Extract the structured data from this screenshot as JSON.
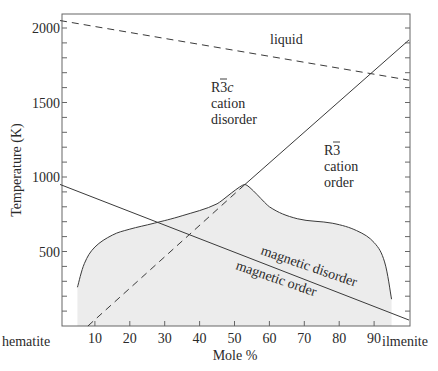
{
  "chart_data": {
    "type": "line",
    "title": "",
    "xlabel": "Mole %",
    "ylabel": "Temperature (K)",
    "xlim": [
      0,
      100
    ],
    "ylim": [
      0,
      2100
    ],
    "grid": false,
    "x_ticks": [
      10,
      20,
      30,
      40,
      50,
      60,
      70,
      80,
      90
    ],
    "y_ticks": [
      500,
      1000,
      1500,
      2000
    ],
    "y_minor_step": 100,
    "x_end_labels": {
      "left": "hematite",
      "right": "ilmenite"
    },
    "series": [
      {
        "name": "liquidus",
        "style": "dashed",
        "x": [
          0,
          100
        ],
        "y": [
          2050,
          1650
        ]
      },
      {
        "name": "cation order-disorder transition",
        "style": "solid",
        "x": [
          0,
          53,
          100
        ],
        "y": [
          null,
          950,
          1920
        ],
        "points": [
          [
            53,
            950
          ],
          [
            100,
            1920
          ]
        ]
      },
      {
        "name": "metastable cation ordering",
        "style": "dashed",
        "x": [
          8,
          53
        ],
        "y": [
          0,
          950
        ]
      },
      {
        "name": "magnetic ordering transition",
        "style": "solid",
        "x": [
          0,
          100
        ],
        "y": [
          950,
          40
        ]
      },
      {
        "name": "miscibility gap boundary",
        "style": "solid",
        "shaded": true,
        "x": [
          5,
          7,
          10,
          15,
          20,
          27,
          35,
          45,
          53,
          60,
          68,
          78,
          85,
          90,
          93,
          95
        ],
        "y": [
          260,
          420,
          530,
          610,
          650,
          690,
          740,
          820,
          950,
          800,
          720,
          690,
          640,
          560,
          430,
          180
        ]
      }
    ],
    "annotations": [
      {
        "text": "liquid",
        "x": 60,
        "y": 1890
      },
      {
        "text": "R3̄c",
        "x": 38,
        "y": 1330
      },
      {
        "text": "cation",
        "x": 38,
        "y": 1220
      },
      {
        "text": "disorder",
        "x": 38,
        "y": 1110
      },
      {
        "text": "R3̄",
        "x": 78,
        "y": 1120
      },
      {
        "text": "cation",
        "x": 78,
        "y": 1010
      },
      {
        "text": "order",
        "x": 78,
        "y": 900
      },
      {
        "text": "magnetic disorder",
        "x": 62,
        "y": 460,
        "rotation": -19
      },
      {
        "text": "magnetic order",
        "x": 52,
        "y": 330,
        "rotation": -19
      }
    ],
    "colors": {
      "line": "#3a3a3a",
      "shade": "#ececec",
      "axis": "#555555"
    }
  },
  "labels": {
    "xlabel": "Mole %",
    "ylabel": "Temperature (K)",
    "left_end": "hematite",
    "right_end": "ilmenite",
    "liquid": "liquid",
    "r3c_symbol": "R3",
    "r3c_suffix": "c",
    "r3c_line1": "cation",
    "r3c_line2": "disorder",
    "r3_symbol": "R3",
    "r3_line1": "cation",
    "r3_line2": "order",
    "mag_disorder": "magnetic disorder",
    "mag_order": "magnetic order"
  }
}
